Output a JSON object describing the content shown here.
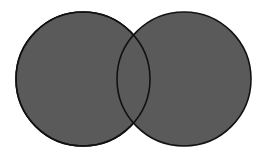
{
  "diagram": {
    "type": "venn",
    "background": "#ffffff",
    "sets": [
      {
        "id": "left",
        "cx": 83,
        "cy": 79,
        "r": 67,
        "fill": "#5a5a5a",
        "stroke": "#111111"
      },
      {
        "id": "right",
        "cx": 184,
        "cy": 79,
        "r": 67,
        "fill": "#5a5a5a",
        "stroke": "#111111"
      }
    ],
    "labels": []
  }
}
